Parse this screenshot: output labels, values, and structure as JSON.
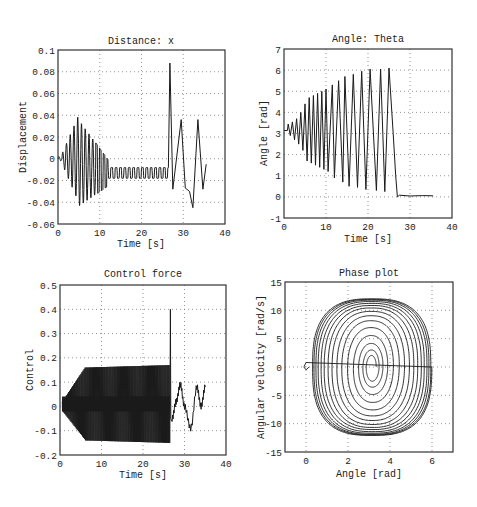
{
  "figure": {
    "width": 477,
    "height": 507,
    "line_color": "#1a1a1a",
    "axis_color": "#333333",
    "grid_color": "#666666"
  },
  "chart_data": [
    {
      "id": "distance",
      "type": "line",
      "title": "Distance: x",
      "xlabel": "Time [s]",
      "ylabel": "Displacement",
      "xlim": [
        0,
        40
      ],
      "ylim": [
        -0.06,
        0.1
      ],
      "xticks": [
        0,
        10,
        20,
        30,
        40
      ],
      "xtick_labels": [
        "0",
        "10",
        "20",
        "30",
        "40"
      ],
      "yticks": [
        -0.06,
        -0.04,
        -0.02,
        0,
        0.02,
        0.04,
        0.06,
        0.08,
        0.1
      ],
      "ytick_labels": [
        "-0.06",
        "-0.04",
        "-0.02",
        "0",
        "0.02",
        "0.04",
        "0.06",
        "0.08",
        "0.1"
      ],
      "grid": true,
      "box": {
        "left": 58,
        "top": 50,
        "right": 225,
        "bottom": 224
      },
      "series": [
        {
          "name": "x(t)",
          "description": "Growing oscillation peaking ~±0.04 near t=4-5s, decays to square-ish oscillation between -0.018 and -0.008 until t≈26.5s, then spike to 0.088 at t≈26.8s, oscillations to 0.036 at t≈29.5s and t≈33.5s, minimum -0.045 at t≈32.3s, ends ≈ -0.005 at t≈35.5s",
          "key_points": [
            [
              0,
              0
            ],
            [
              1,
              0.002
            ],
            [
              2,
              -0.015
            ],
            [
              3.5,
              0.03
            ],
            [
              4,
              0.035
            ],
            [
              4.5,
              -0.037
            ],
            [
              5,
              0.035
            ],
            [
              5.2,
              -0.046
            ],
            [
              6,
              0.025
            ],
            [
              10,
              -0.022
            ],
            [
              15,
              -0.018
            ],
            [
              20,
              -0.018
            ],
            [
              26.5,
              -0.018
            ],
            [
              26.8,
              0.088
            ],
            [
              27.5,
              -0.028
            ],
            [
              29.5,
              0.036
            ],
            [
              30.5,
              -0.027
            ],
            [
              31.5,
              -0.03
            ],
            [
              32.3,
              -0.045
            ],
            [
              33.5,
              0.036
            ],
            [
              34.7,
              -0.028
            ],
            [
              35.5,
              -0.005
            ]
          ]
        }
      ]
    },
    {
      "id": "theta",
      "type": "line",
      "title": "Angle: Theta",
      "xlabel": "Time [s]",
      "ylabel": "Angle [rad]",
      "xlim": [
        0,
        40
      ],
      "ylim": [
        -1,
        7
      ],
      "xticks": [
        0,
        10,
        20,
        30,
        40
      ],
      "xtick_labels": [
        "0",
        "10",
        "20",
        "30",
        "40"
      ],
      "yticks": [
        -1,
        0,
        1,
        2,
        3,
        4,
        5,
        6,
        7
      ],
      "ytick_labels": [
        "-1",
        "0",
        "1",
        "2",
        "3",
        "4",
        "5",
        "6",
        "7"
      ],
      "grid": true,
      "box": {
        "left": 284,
        "top": 49,
        "right": 452,
        "bottom": 218
      },
      "series": [
        {
          "name": "theta(t)",
          "description": "Oscillation about pi (~3.14) with growing amplitude, peaks rising from ~3.5 to ~6.1 and troughs falling to ~0.3 by t≈25s; drops to ~0 at t≈27s and stays ~0.05 until t≈35.5s",
          "peaks": [
            [
              1,
              3.45
            ],
            [
              2,
              3.55
            ],
            [
              3,
              3.7
            ],
            [
              4,
              4.0
            ],
            [
              5,
              4.4
            ],
            [
              6,
              4.7
            ],
            [
              7,
              4.8
            ],
            [
              8,
              4.9
            ],
            [
              9,
              5.0
            ],
            [
              10,
              5.1
            ],
            [
              11.5,
              5.3
            ],
            [
              13,
              5.5
            ],
            [
              14.5,
              5.7
            ],
            [
              16.5,
              5.8
            ],
            [
              18.5,
              5.95
            ],
            [
              20.5,
              6.05
            ],
            [
              23,
              6.05
            ],
            [
              25,
              6.1
            ]
          ],
          "troughs": [
            [
              1.5,
              2.9
            ],
            [
              2.5,
              2.7
            ],
            [
              3.5,
              2.5
            ],
            [
              4.5,
              2.2
            ],
            [
              5.5,
              1.7
            ],
            [
              6.5,
              1.6
            ],
            [
              7.5,
              1.5
            ],
            [
              8.5,
              1.4
            ],
            [
              9.5,
              1.3
            ],
            [
              10.5,
              1.2
            ],
            [
              12,
              0.9
            ],
            [
              14,
              0.7
            ],
            [
              15.5,
              0.5
            ],
            [
              17.5,
              0.45
            ],
            [
              19.5,
              0.35
            ],
            [
              22,
              0.3
            ],
            [
              24,
              0.25
            ]
          ],
          "settle": [
            [
              27,
              0.0
            ],
            [
              35.5,
              0.05
            ]
          ]
        }
      ]
    },
    {
      "id": "control",
      "type": "line",
      "title": "Control force",
      "xlabel": "Time [s]",
      "ylabel": "Control",
      "xlim": [
        0,
        40
      ],
      "ylim": [
        -0.2,
        0.5
      ],
      "xticks": [
        0,
        10,
        20,
        30,
        40
      ],
      "xtick_labels": [
        "0",
        "10",
        "20",
        "30",
        "40"
      ],
      "yticks": [
        -0.2,
        -0.1,
        0,
        0.1,
        0.2,
        0.3,
        0.4,
        0.5
      ],
      "ytick_labels": [
        "-0.2",
        "-0.1",
        "0",
        "0.1",
        "0.2",
        "0.3",
        "0.4",
        "0.5"
      ],
      "grid": true,
      "box": {
        "left": 60,
        "top": 285,
        "right": 226,
        "bottom": 455
      },
      "series": [
        {
          "name": "u(t)",
          "description": "Bang-bang style spikes: grows from ±0.05 at t≈1s to +0.16/-0.15 from t≈5s through t≈26s with dense band around 0-0.04; single spike to 0.40 at t≈26.5s; then smooth noisy oscillation: 0.09 at t≈29s, -0.09 at t≈31.5s, 0.08 at t≈33s, 0.08 at t≈35s",
          "spike_max": [
            [
              1,
              0.05
            ],
            [
              2,
              0.07
            ],
            [
              3,
              0.09
            ],
            [
              4,
              0.13
            ],
            [
              5,
              0.15
            ],
            [
              6,
              0.16
            ],
            [
              26,
              0.17
            ]
          ],
          "spike_min": [
            [
              1.5,
              -0.04
            ],
            [
              2.5,
              -0.06
            ],
            [
              3.5,
              -0.09
            ],
            [
              4.5,
              -0.12
            ],
            [
              5.5,
              -0.14
            ],
            [
              26,
              -0.15
            ]
          ],
          "peak": [
            26.6,
            0.4
          ],
          "tail": [
            [
              27,
              -0.05
            ],
            [
              28,
              0.02
            ],
            [
              29,
              0.09
            ],
            [
              30,
              0.0
            ],
            [
              31.5,
              -0.09
            ],
            [
              33,
              0.08
            ],
            [
              34,
              0.0
            ],
            [
              35,
              0.08
            ]
          ]
        }
      ]
    },
    {
      "id": "phase",
      "type": "line",
      "title": "Phase plot",
      "xlabel": "Angle [rad]",
      "ylabel": "Angular velocity [rad/s]",
      "xlim": [
        -1,
        7
      ],
      "ylim": [
        -15,
        15
      ],
      "xticks": [
        0,
        2,
        4,
        6
      ],
      "xtick_labels": [
        "0",
        "2",
        "4",
        "6"
      ],
      "yticks": [
        -15,
        -10,
        -5,
        0,
        5,
        10,
        15
      ],
      "ytick_labels": [
        "-15",
        "-10",
        "-5",
        "0",
        "5",
        "10",
        "15"
      ],
      "grid": true,
      "box": {
        "left": 285,
        "top": 282,
        "right": 453,
        "bottom": 452
      },
      "series": [
        {
          "name": "theta vs theta_dot",
          "description": "Expanding spiral around (pi, 0); outermost orbit diamond-shaped reaching angle 0.3..6.0 and velocity ±12; small hook near (0, 0)",
          "center": [
            3.14,
            0
          ],
          "orbit_half_widths": [
            0.2,
            0.35,
            0.55,
            0.8,
            1.1,
            1.4,
            1.65,
            1.9,
            2.1,
            2.3,
            2.45,
            2.6,
            2.7,
            2.8,
            2.85
          ],
          "orbit_half_heights": [
            1.8,
            2.8,
            4.0,
            5.5,
            7.0,
            8.3,
            9.2,
            10.0,
            10.6,
            11.0,
            11.4,
            11.7,
            11.9,
            12.0,
            12.1
          ],
          "hook": [
            [
              0,
              0.8
            ],
            [
              -0.1,
              0
            ],
            [
              0,
              -0.5
            ],
            [
              0.15,
              0
            ]
          ]
        }
      ]
    }
  ]
}
